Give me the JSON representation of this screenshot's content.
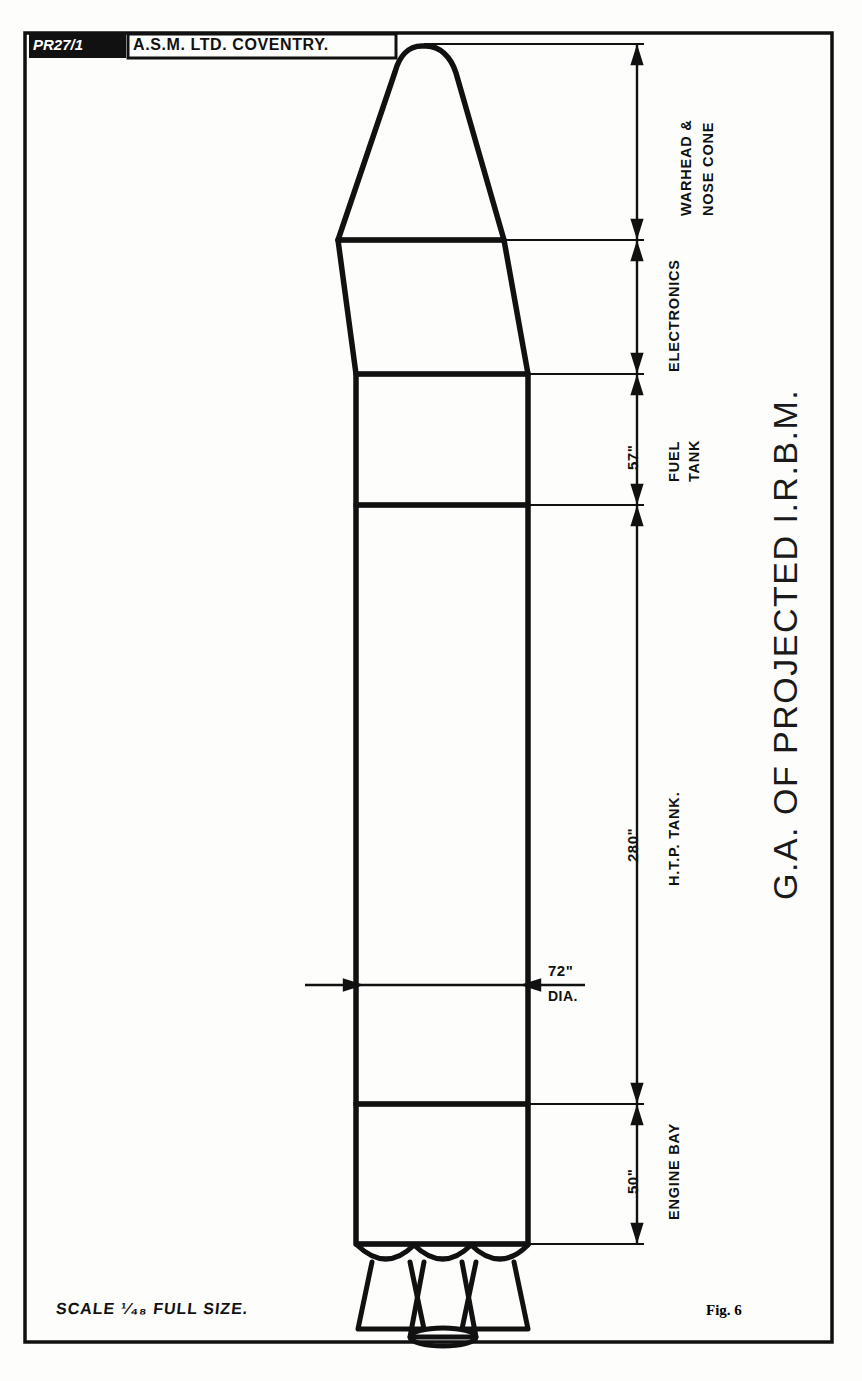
{
  "sheet": {
    "width": 862,
    "height": 1381,
    "background_color": "#fdfdfb",
    "ink_color": "#111111",
    "border": {
      "x": 25,
      "y": 33,
      "width": 807,
      "height": 1309
    }
  },
  "title_block": {
    "drawing_number": "PR27/1",
    "company": "A.S.M. LTD.  COVENTRY."
  },
  "main_title": "G.A. OF PROJECTED  I.R.B.M.",
  "footer": {
    "scale_note": "SCALE  ¹⁄₄₈ FULL SIZE.",
    "figure_number": "Fig. 6"
  },
  "sections": [
    {
      "name": "warhead-nose-cone",
      "label_lines": [
        "WARHEAD &",
        "NOSE CONE"
      ],
      "dimension": "",
      "y_top": 44,
      "y_bottom": 240
    },
    {
      "name": "electronics",
      "label_lines": [
        "ELECTRONICS"
      ],
      "dimension": "",
      "y_top": 240,
      "y_bottom": 374
    },
    {
      "name": "fuel-tank",
      "label_lines": [
        "FUEL",
        "TANK"
      ],
      "dimension": "57\"",
      "y_top": 374,
      "y_bottom": 505
    },
    {
      "name": "htp-tank",
      "label_lines": [
        "H.T.P. TANK."
      ],
      "dimension": "280\"",
      "y_top": 505,
      "y_bottom": 1104
    },
    {
      "name": "engine-bay",
      "label_lines": [
        "ENGINE BAY"
      ],
      "dimension": "50\"",
      "y_top": 1104,
      "y_bottom": 1244
    }
  ],
  "diameter_callout": {
    "value": "72\"",
    "unit_label": "DIA.",
    "y": 985
  },
  "rocket": {
    "nose_tip_y": 44,
    "body_left_x": 356,
    "body_right_x": 528,
    "body_top_y": 374,
    "body_bottom_y": 1244,
    "nose_base_y": 240,
    "electronics_top_width": 164,
    "engine_count": 3
  }
}
